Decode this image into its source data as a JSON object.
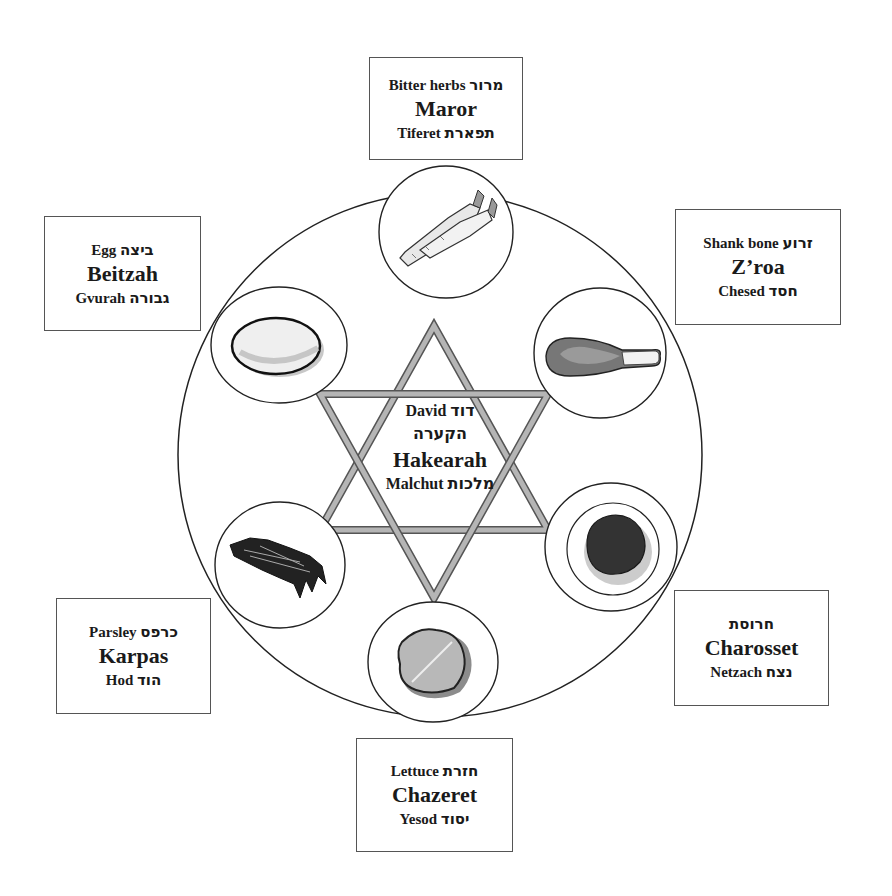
{
  "center": {
    "line1_en": "David",
    "line1_he": "דוד",
    "line2_he": "הקערה",
    "name": "Hakearah",
    "line4_en": "Malchut",
    "line4_he": "מלכות"
  },
  "items": [
    {
      "id": "maror",
      "english": "Bitter herbs",
      "hebrew": "מרור",
      "name": "Maror",
      "sefirah": "Tiferet",
      "sefirah_he": "תפארת",
      "icon": "horseradish-icon"
    },
    {
      "id": "zroa",
      "english": "Shank bone",
      "hebrew": "זרוע",
      "name": "Z’roa",
      "sefirah": "Chesed",
      "sefirah_he": "חסד",
      "icon": "shank-bone-icon"
    },
    {
      "id": "beitzah",
      "english": "Egg",
      "hebrew": "ביצה",
      "name": "Beitzah",
      "sefirah": "Gvurah",
      "sefirah_he": "גבורה",
      "icon": "egg-icon"
    },
    {
      "id": "charosset",
      "english": "",
      "hebrew": "חרוסת",
      "name": "Charosset",
      "sefirah": "Netzach",
      "sefirah_he": "נצח",
      "icon": "charoset-icon"
    },
    {
      "id": "karpas",
      "english": "Parsley",
      "hebrew": "כרפס",
      "name": "Karpas",
      "sefirah": "Hod",
      "sefirah_he": "הוד",
      "icon": "parsley-icon"
    },
    {
      "id": "chazeret",
      "english": "Lettuce",
      "hebrew": "חזרת",
      "name": "Chazeret",
      "sefirah": "Yesod",
      "sefirah_he": "יסוד",
      "icon": "lettuce-icon"
    }
  ],
  "colors": {
    "outline": "#222222",
    "star_fill": "#9a9a9a",
    "star_edge": "#555555",
    "box_border": "#555555"
  }
}
